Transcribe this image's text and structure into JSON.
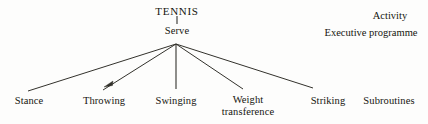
{
  "diagram": {
    "background_color": "#fdfdfc",
    "line_color": "#33322c",
    "text_color": "#15150f",
    "nodes": {
      "root": {
        "label": "TENNIS",
        "x": 177,
        "y": 11
      },
      "mid": {
        "label": "Serve",
        "x": 177,
        "y": 30
      },
      "leaves": [
        {
          "label": "Stance",
          "x": 29,
          "y": 100
        },
        {
          "label": "Throwing",
          "x": 104,
          "y": 100
        },
        {
          "label": "Swinging",
          "x": 176,
          "y": 100
        },
        {
          "label": "Weight",
          "label2": "transference",
          "x": 248,
          "y": 100
        },
        {
          "label": "Striking",
          "x": 328,
          "y": 100
        },
        {
          "label": "Subroutines",
          "x": 389,
          "y": 100
        }
      ]
    },
    "annotations": [
      {
        "label": "Activity",
        "x": 390,
        "y": 15
      },
      {
        "label": "Executive programme",
        "x": 371,
        "y": 32
      }
    ],
    "edges": [
      {
        "name": "tennis-to-serve",
        "x1": 177,
        "y1": 16,
        "x2": 177,
        "y2": 24
      },
      {
        "name": "serve-to-stance",
        "x1": 176,
        "y1": 44,
        "x2": 28,
        "y2": 91
      },
      {
        "name": "serve-to-throwing",
        "x1": 176,
        "y1": 44,
        "x2": 103,
        "y2": 90
      },
      {
        "name": "serve-to-swinging",
        "x1": 176,
        "y1": 44,
        "x2": 176,
        "y2": 89
      },
      {
        "name": "serve-to-weight-transference",
        "x1": 176,
        "y1": 44,
        "x2": 243,
        "y2": 89
      },
      {
        "name": "serve-to-striking",
        "x1": 176,
        "y1": 44,
        "x2": 313,
        "y2": 88
      }
    ],
    "arrow_marks": [
      {
        "name": "throwing-arrowhead",
        "x": 108,
        "y": 85
      }
    ]
  }
}
